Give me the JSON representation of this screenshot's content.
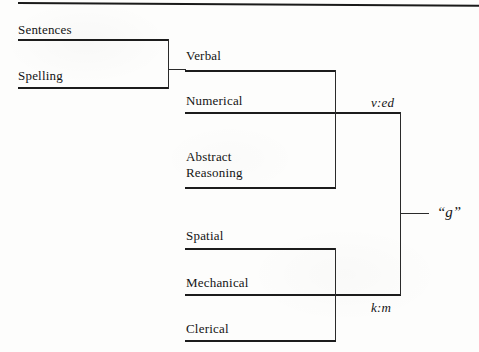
{
  "figure": {
    "top_rule": "horizontal-rule",
    "tests": [
      {
        "id": "sentences",
        "label": "Sentences"
      },
      {
        "id": "spelling",
        "label": "Spelling"
      },
      {
        "id": "verbal",
        "label": "Verbal"
      },
      {
        "id": "numerical",
        "label": "Numerical"
      },
      {
        "id": "abstract",
        "label": "Abstract\nReasoning"
      },
      {
        "id": "spatial",
        "label": "Spatial"
      },
      {
        "id": "mechanical",
        "label": "Mechanical"
      },
      {
        "id": "clerical",
        "label": "Clerical"
      }
    ],
    "group_factors": [
      {
        "id": "ved",
        "label": "v:ed"
      },
      {
        "id": "km",
        "label": "k:m"
      }
    ],
    "general_factor": {
      "id": "g",
      "label": "“g”"
    },
    "ink_color": "#1c1c1c",
    "paper_color": "#fdfdfc"
  }
}
